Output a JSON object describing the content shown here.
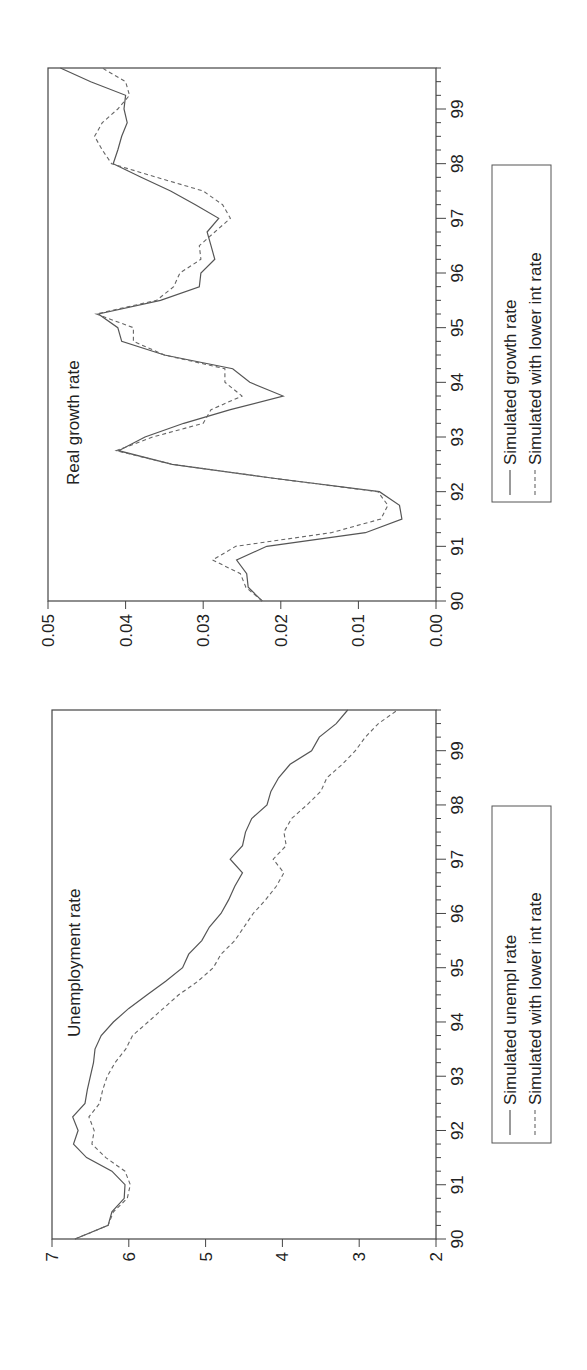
{
  "figure": {
    "orientation": "rotated-90-clockwise"
  },
  "chart_data": [
    {
      "type": "line",
      "title": "Real growth rate",
      "xlabel": "",
      "ylabel": "",
      "x_tick_labels": [
        "90",
        "91",
        "92",
        "93",
        "94",
        "95",
        "96",
        "97",
        "98",
        "99"
      ],
      "y_tick_labels": [
        "0.00",
        "0.01",
        "0.02",
        "0.03",
        "0.04",
        "0.05"
      ],
      "ylim": [
        0.0,
        0.05
      ],
      "xlim": [
        90.0,
        99.75
      ],
      "legend": [
        "Simulated growth rate",
        "Simulated with lower int rate"
      ],
      "x": [
        90.0,
        90.25,
        90.5,
        90.75,
        91.0,
        91.25,
        91.5,
        91.75,
        92.0,
        92.25,
        92.5,
        92.75,
        93.0,
        93.25,
        93.5,
        93.75,
        94.0,
        94.25,
        94.5,
        94.75,
        95.0,
        95.25,
        95.5,
        95.75,
        96.0,
        96.25,
        96.5,
        96.75,
        97.0,
        97.25,
        97.5,
        97.75,
        98.0,
        98.25,
        98.5,
        98.75,
        99.0,
        99.25,
        99.5,
        99.75
      ],
      "series": [
        {
          "name": "Simulated growth rate",
          "style": "solid",
          "values": [
            0.0224,
            0.0242,
            0.0244,
            0.0257,
            0.0218,
            0.0091,
            0.0044,
            0.0047,
            0.0073,
            0.0212,
            0.034,
            0.0409,
            0.0375,
            0.0325,
            0.0265,
            0.0197,
            0.024,
            0.0262,
            0.035,
            0.0405,
            0.041,
            0.0435,
            0.0355,
            0.0305,
            0.0303,
            0.0285,
            0.029,
            0.0295,
            0.028,
            0.031,
            0.0342,
            0.038,
            0.0416,
            0.041,
            0.0405,
            0.0398,
            0.0402,
            0.04,
            0.0445,
            0.0484
          ]
        },
        {
          "name": "Simulated with lower int rate",
          "style": "dashed",
          "values": [
            0.0224,
            0.0245,
            0.0252,
            0.0288,
            0.0258,
            0.0135,
            0.0071,
            0.0062,
            0.0075,
            0.0212,
            0.034,
            0.0412,
            0.0365,
            0.03,
            0.029,
            0.025,
            0.0272,
            0.0272,
            0.035,
            0.039,
            0.039,
            0.0438,
            0.036,
            0.0338,
            0.033,
            0.0303,
            0.0305,
            0.0285,
            0.0265,
            0.0275,
            0.03,
            0.036,
            0.0418,
            0.043,
            0.044,
            0.043,
            0.041,
            0.0395,
            0.04,
            0.043
          ]
        }
      ]
    },
    {
      "type": "line",
      "title": "Unemployment rate",
      "xlabel": "",
      "ylabel": "",
      "x_tick_labels": [
        "90",
        "91",
        "92",
        "93",
        "94",
        "95",
        "96",
        "97",
        "98",
        "99"
      ],
      "y_tick_labels": [
        "2",
        "3",
        "4",
        "5",
        "6",
        "7"
      ],
      "ylim": [
        2,
        7
      ],
      "xlim": [
        90.0,
        99.75
      ],
      "legend": [
        "Simulated unempl rate",
        "Simulated with lower int rate"
      ],
      "x": [
        90.0,
        90.25,
        90.5,
        90.75,
        91.0,
        91.25,
        91.5,
        91.75,
        92.0,
        92.25,
        92.5,
        92.75,
        93.0,
        93.25,
        93.5,
        93.75,
        94.0,
        94.25,
        94.5,
        94.75,
        95.0,
        95.25,
        95.5,
        95.75,
        96.0,
        96.25,
        96.5,
        96.75,
        97.0,
        97.25,
        97.5,
        97.75,
        98.0,
        98.25,
        98.5,
        98.75,
        99.0,
        99.25,
        99.5,
        99.75
      ],
      "series": [
        {
          "name": "Simulated unempl rate",
          "style": "solid",
          "values": [
            6.7,
            6.27,
            6.22,
            6.06,
            6.05,
            6.22,
            6.55,
            6.72,
            6.66,
            6.73,
            6.57,
            6.54,
            6.5,
            6.46,
            6.44,
            6.36,
            6.2,
            6.0,
            5.76,
            5.52,
            5.3,
            5.22,
            5.05,
            4.95,
            4.8,
            4.7,
            4.62,
            4.52,
            4.68,
            4.52,
            4.48,
            4.4,
            4.2,
            4.15,
            4.05,
            3.9,
            3.62,
            3.52,
            3.3,
            3.15
          ]
        },
        {
          "name": "Simulated with lower int rate",
          "style": "dashed",
          "values": [
            6.7,
            6.27,
            6.2,
            6.02,
            5.98,
            6.05,
            6.3,
            6.48,
            6.45,
            6.52,
            6.38,
            6.34,
            6.28,
            6.18,
            6.04,
            5.95,
            5.75,
            5.55,
            5.35,
            5.1,
            4.9,
            4.8,
            4.62,
            4.5,
            4.38,
            4.22,
            4.08,
            3.98,
            4.12,
            3.95,
            3.98,
            3.88,
            3.68,
            3.5,
            3.42,
            3.22,
            3.05,
            2.92,
            2.75,
            2.5
          ]
        }
      ]
    }
  ]
}
